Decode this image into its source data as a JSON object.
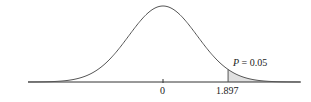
{
  "chart_data": {
    "type": "area",
    "title": "",
    "xlabel": "",
    "ylabel": "",
    "x_ticks": [
      "0",
      "1.897"
    ],
    "x_tick_values": [
      0,
      1.897
    ],
    "shaded_region": {
      "from": 1.897,
      "to": "inf",
      "color": "#e0e0e0"
    },
    "annotation": "P = 0.05",
    "grid": false,
    "legend": null
  },
  "labels": {
    "tick_zero": "0",
    "tick_critical": "1.897",
    "p_label_var": "P",
    "p_label_rest": " = 0.05"
  },
  "colors": {
    "curve": "#555555",
    "shade": "#e0e0e0",
    "axis": "#333333"
  }
}
